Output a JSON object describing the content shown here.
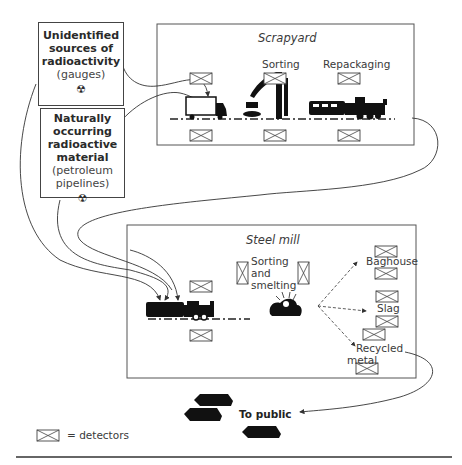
{
  "sources": [
    {
      "title": "Unidentified sources of radioactivity",
      "title_lines": [
        "Unidentified",
        "sources of",
        "radioactivity"
      ],
      "subtitle": "(gauges)",
      "icon": "radiation-hazard-icon"
    },
    {
      "title": "Naturally occurring radioactive material",
      "title_lines": [
        "Naturally",
        "occurring",
        "radioactive",
        "material"
      ],
      "subtitle_lines": [
        "(petroleum",
        "pipelines)"
      ],
      "icon": "radiation-hazard-icon"
    }
  ],
  "scrapyard": {
    "title": "Scrapyard",
    "stages": [
      "Sorting",
      "Repackaging"
    ],
    "vehicles": [
      "truck",
      "crane",
      "train"
    ]
  },
  "steel_mill": {
    "title": "Steel mill",
    "process_label_lines": [
      "Sorting",
      "and",
      "smelting"
    ],
    "outputs": [
      "Baghouse",
      "Slag",
      "Recycled metal"
    ],
    "outputs_lines": {
      "recycled": [
        "Recycled",
        "metal"
      ]
    }
  },
  "public": {
    "label": "To public"
  },
  "legend": {
    "symbol": "detector-icon",
    "text": "= detectors"
  },
  "colors": {
    "line": "#333333",
    "fill": "#111111",
    "border": "#444444"
  }
}
